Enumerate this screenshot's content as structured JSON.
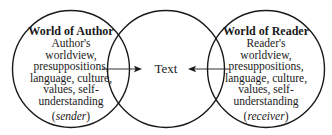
{
  "diagram": {
    "type": "venn-communication-model",
    "circles": [
      {
        "id": "author",
        "cx": 71,
        "cy": 69,
        "r": 59
      },
      {
        "id": "text",
        "cx": 166,
        "cy": 69,
        "r": 59
      },
      {
        "id": "reader",
        "cx": 266,
        "cy": 69,
        "r": 59
      }
    ],
    "stroke_color": "#1a1a1a",
    "left": {
      "title": "World of Author",
      "lines": [
        "Author's",
        "worldview,",
        "presuppositions,",
        "language, culture,",
        "values, self-",
        "understanding"
      ],
      "role": "sender"
    },
    "center": {
      "label": "Text"
    },
    "right": {
      "title": "World of Reader",
      "lines": [
        "Reader's",
        "worldview,",
        "presuppositions,",
        "language, culture,",
        "values, self-",
        "understanding"
      ],
      "role": "receiver"
    },
    "arrows": [
      {
        "from": "author",
        "to": "text",
        "direction": "right"
      },
      {
        "from": "reader",
        "to": "text",
        "direction": "left"
      }
    ],
    "paren_open": "(",
    "paren_close": ")"
  }
}
